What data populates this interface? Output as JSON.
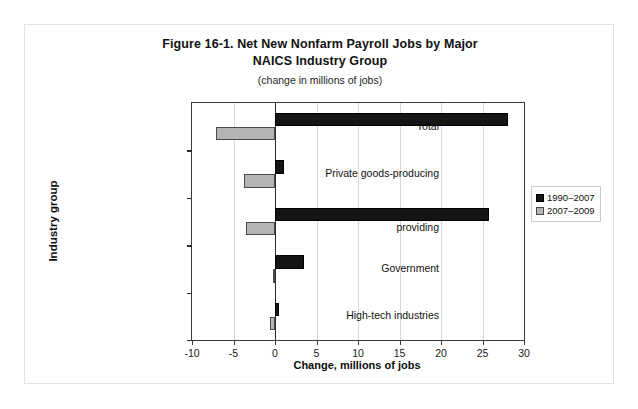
{
  "figure": {
    "title_line1": "Figure 16-1. Net New Nonfarm Payroll Jobs by Major",
    "title_line2": "NAICS Industry Group",
    "subtitle": "(change in millions of jobs)"
  },
  "legend": {
    "position": "right",
    "entries": [
      {
        "label": "1990–2007",
        "color": "#151515"
      },
      {
        "label": "2007–2009",
        "color": "#b4b4b4"
      }
    ]
  },
  "chart_data": {
    "type": "bar",
    "orientation": "horizontal",
    "title": "Figure 16-1. Net New Nonfarm Payroll Jobs by Major NAICS Industry Group",
    "subtitle": "(change in millions of jobs)",
    "xlabel": "Change, millions of jobs",
    "ylabel": "Industry group",
    "xlim": [
      -10,
      30
    ],
    "xticks": [
      -10,
      -5,
      0,
      5,
      10,
      15,
      20,
      25,
      30
    ],
    "xticklabels": [
      "-10",
      "-5",
      "0",
      "5",
      "10",
      "15",
      "20",
      "25",
      "30"
    ],
    "grid": "vertical",
    "categories": [
      "Total",
      "Private goods-producing",
      "Private service-\nproviding",
      "Government",
      "High-tech industries"
    ],
    "series": [
      {
        "name": "1990–2007",
        "color": "#151515",
        "values": [
          28.1,
          1.1,
          25.8,
          3.5,
          0.5
        ]
      },
      {
        "name": "2007–2009",
        "color": "#b4b4b4",
        "values": [
          -7.1,
          -3.7,
          -3.5,
          -0.2,
          -0.6
        ]
      }
    ]
  }
}
